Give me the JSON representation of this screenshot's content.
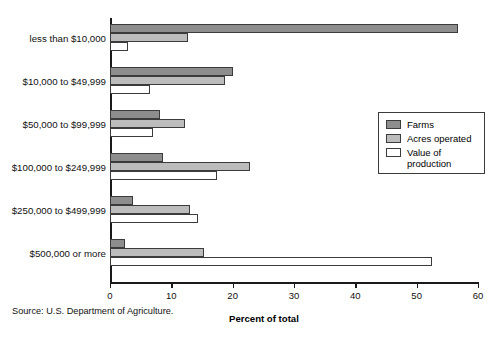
{
  "chart_data": {
    "type": "bar",
    "orientation": "horizontal",
    "title": "",
    "xlabel": "Percent of total",
    "ylabel": "",
    "xlim": [
      0,
      60
    ],
    "xticks": [
      0,
      10,
      20,
      30,
      40,
      50,
      60
    ],
    "grid": false,
    "legend_position": "right-middle",
    "categories": [
      "less than $10,000",
      "$10,000 to $49,999",
      "$50,000 to $99,999",
      "$100,000 to $249,999",
      "$250,000 to $499,999",
      "$500,000 or more"
    ],
    "series": [
      {
        "name": "Farms",
        "color": "#8d8d8d",
        "values": [
          56.7,
          20.0,
          8.1,
          8.7,
          3.8,
          2.4
        ]
      },
      {
        "name": "Acres operated",
        "color": "#bcbcbc",
        "values": [
          12.7,
          18.7,
          12.2,
          22.8,
          13.1,
          15.4
        ]
      },
      {
        "name": "Value of production",
        "color": "#ffffff",
        "values": [
          3.0,
          6.5,
          7.0,
          17.4,
          14.3,
          52.5
        ]
      }
    ],
    "source_note": "Source: U.S. Department of Agriculture."
  },
  "legend": {
    "items": [
      {
        "label": "Farms"
      },
      {
        "label": "Acres operated"
      },
      {
        "label": "Value of production"
      }
    ]
  },
  "axis": {
    "tick_labels": [
      "0",
      "10",
      "20",
      "30",
      "40",
      "50",
      "60"
    ],
    "x_title": "Percent of total"
  },
  "footer": {
    "source": "Source: U.S. Department of Agriculture."
  }
}
